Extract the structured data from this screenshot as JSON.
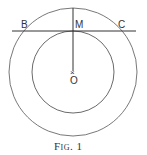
{
  "figure": {
    "caption": "Fig. 1",
    "labels": {
      "B": "B",
      "M": "M",
      "C": "C",
      "O": "O",
      "center_mark": "×"
    },
    "geometry": {
      "center": [
        73,
        72
      ],
      "outer_radius": 64,
      "inner_radius": 41,
      "chord_y": 31,
      "chord_x": [
        12,
        136
      ]
    },
    "colors": {
      "stroke": "#444444",
      "background": "#ffffff"
    }
  }
}
